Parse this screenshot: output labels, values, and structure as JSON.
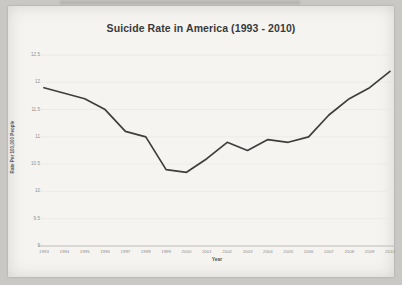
{
  "page": {
    "background_color": "#c9c8c5",
    "paper_color": "#f5f4f1"
  },
  "chart_data": {
    "type": "line",
    "title": "Suicide Rate in America (1993 - 2010)",
    "xlabel": "Year",
    "ylabel": "Rate Per 100,000 People",
    "x": [
      1993,
      1994,
      1995,
      1996,
      1997,
      1998,
      1999,
      2000,
      2001,
      2002,
      2003,
      2004,
      2005,
      2006,
      2007,
      2008,
      2009,
      2010
    ],
    "values": [
      11.9,
      11.8,
      11.7,
      11.5,
      11.1,
      11.0,
      10.4,
      10.35,
      10.6,
      10.9,
      10.75,
      10.95,
      10.9,
      11.0,
      11.4,
      11.7,
      11.9,
      12.2
    ],
    "ylim": [
      9,
      12.5
    ],
    "ytick_step": 0.5,
    "grid": true,
    "legend": "none",
    "line_color": "#3e3e3e",
    "grid_color": "#e9e8e4",
    "axis_color": "#bdbcb9",
    "tick_text_color": "#908f8c"
  }
}
